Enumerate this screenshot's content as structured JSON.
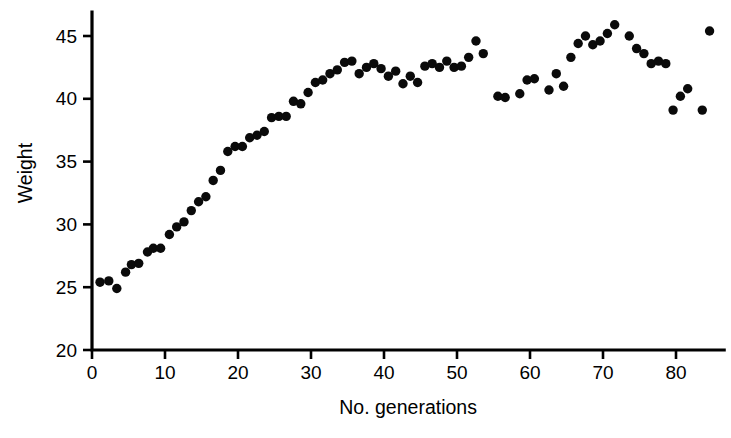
{
  "figure": {
    "width": 731,
    "height": 438,
    "background": "#ffffff",
    "ink_color": "#000000",
    "marker_color": "#0a0a0a"
  },
  "chart_data": {
    "type": "scatter",
    "title": "",
    "xlabel": "No. generations",
    "ylabel": "Weight",
    "xlim": [
      0,
      86
    ],
    "ylim": [
      20,
      46.5
    ],
    "xticks": [
      0,
      10,
      20,
      30,
      40,
      50,
      60,
      70,
      80
    ],
    "yticks": [
      20,
      25,
      30,
      35,
      40,
      45
    ],
    "xtick_labels": [
      "0",
      "10",
      "20",
      "30",
      "40",
      "50",
      "60",
      "70",
      "80"
    ],
    "ytick_labels": [
      "20",
      "25",
      "30",
      "35",
      "40",
      "45"
    ],
    "grid": false,
    "legend": null,
    "marker": "filled-circle",
    "marker_size_px": 5.2,
    "series": [
      {
        "name": "Weight per generation",
        "x": [
          1.1,
          2.3,
          3.4,
          4.6,
          5.4,
          6.4,
          7.6,
          8.4,
          9.4,
          10.6,
          11.6,
          12.6,
          13.6,
          14.6,
          15.6,
          16.6,
          17.6,
          18.6,
          19.6,
          20.6,
          21.6,
          22.6,
          23.6,
          24.6,
          25.6,
          26.6,
          27.6,
          28.6,
          29.6,
          30.6,
          31.6,
          32.6,
          33.6,
          34.6,
          35.6,
          36.6,
          37.6,
          38.6,
          39.6,
          40.6,
          41.6,
          42.6,
          43.6,
          44.6,
          45.6,
          46.6,
          47.6,
          48.6,
          49.6,
          50.6,
          51.6,
          52.6,
          53.6,
          55.6,
          56.6,
          58.6,
          59.6,
          60.6,
          62.6,
          63.6,
          64.6,
          65.6,
          66.6,
          67.6,
          68.6,
          69.6,
          70.6,
          71.6,
          73.6,
          74.6,
          75.6,
          76.6,
          77.6,
          78.6,
          79.6,
          80.6,
          81.6,
          83.6,
          84.6
        ],
        "y": [
          25.4,
          25.5,
          24.9,
          26.2,
          26.8,
          26.9,
          27.8,
          28.1,
          28.1,
          29.2,
          29.8,
          30.2,
          31.1,
          31.8,
          32.2,
          33.5,
          34.3,
          35.8,
          36.2,
          36.2,
          36.9,
          37.1,
          37.4,
          38.5,
          38.6,
          38.6,
          39.8,
          39.6,
          40.5,
          41.3,
          41.5,
          42.0,
          42.3,
          42.9,
          43.0,
          42.0,
          42.5,
          42.8,
          42.4,
          41.8,
          42.2,
          41.2,
          41.8,
          41.3,
          42.6,
          42.8,
          42.5,
          43.0,
          42.5,
          42.6,
          43.3,
          44.6,
          43.6,
          40.2,
          40.1,
          40.4,
          41.5,
          41.6,
          40.7,
          42.0,
          41.0,
          43.3,
          44.4,
          45.0,
          44.3,
          44.6,
          45.2,
          45.9,
          45.0,
          44.0,
          43.6,
          42.8,
          43.0,
          42.8,
          39.1,
          40.2,
          40.8,
          39.1,
          45.4
        ]
      }
    ]
  }
}
